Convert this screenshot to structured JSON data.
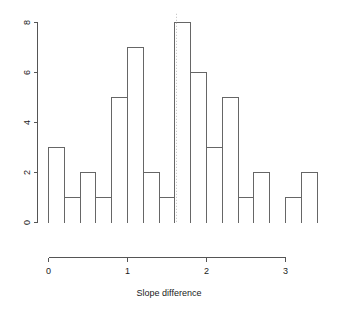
{
  "chart_data": {
    "type": "bar",
    "subtype": "histogram",
    "title": "",
    "subtitle": "",
    "xlabel": "Slope difference",
    "ylabel": "",
    "xlim": [
      -0.02,
      3.42
    ],
    "ylim": [
      0,
      8.3
    ],
    "grid": false,
    "legend": null,
    "bin_width": 0.2,
    "bin_edges": [
      0.0,
      0.2,
      0.4,
      0.6,
      0.8,
      1.0,
      1.2,
      1.4,
      1.6,
      1.8,
      2.0,
      2.2,
      2.4,
      2.6,
      2.8,
      3.0,
      3.2,
      3.4
    ],
    "bin_centers": [
      0.1,
      0.3,
      0.5,
      0.7,
      0.9,
      1.1,
      1.3,
      1.5,
      1.7,
      1.9,
      2.1,
      2.3,
      2.5,
      2.7,
      2.9,
      3.1,
      3.3
    ],
    "categories": [
      "0.0-0.2",
      "0.2-0.4",
      "0.4-0.6",
      "0.6-0.8",
      "0.8-1.0",
      "1.0-1.2",
      "1.2-1.4",
      "1.4-1.6",
      "1.6-1.8",
      "1.8-2.0",
      "2.0-2.2",
      "2.2-2.4",
      "2.4-2.6",
      "2.6-2.8",
      "2.8-3.0",
      "3.0-3.2",
      "3.2-3.4"
    ],
    "values": [
      3,
      1,
      2,
      1,
      5,
      7,
      2,
      1,
      8,
      6,
      3,
      5,
      1,
      2,
      0,
      1,
      2
    ],
    "total_count": 50,
    "xticks": [
      0,
      1,
      2,
      3
    ],
    "xtick_labels": [
      "0",
      "1",
      "2",
      "3"
    ],
    "yticks": [
      0,
      2,
      4,
      6,
      8
    ],
    "ytick_labels": [
      "0",
      "2",
      "4",
      "6",
      "8"
    ],
    "annotations": [
      {
        "name": "vertical-reference-line",
        "type": "vline",
        "x": 1.62,
        "style": "dotted",
        "color": "#bdbdbd"
      }
    ],
    "colors": {
      "bar_fill": "none",
      "bar_stroke": "#666666",
      "axis": "#555555",
      "text": "#1a1a1a",
      "reference_line": "#bdbdbd",
      "background": "#ffffff"
    }
  }
}
